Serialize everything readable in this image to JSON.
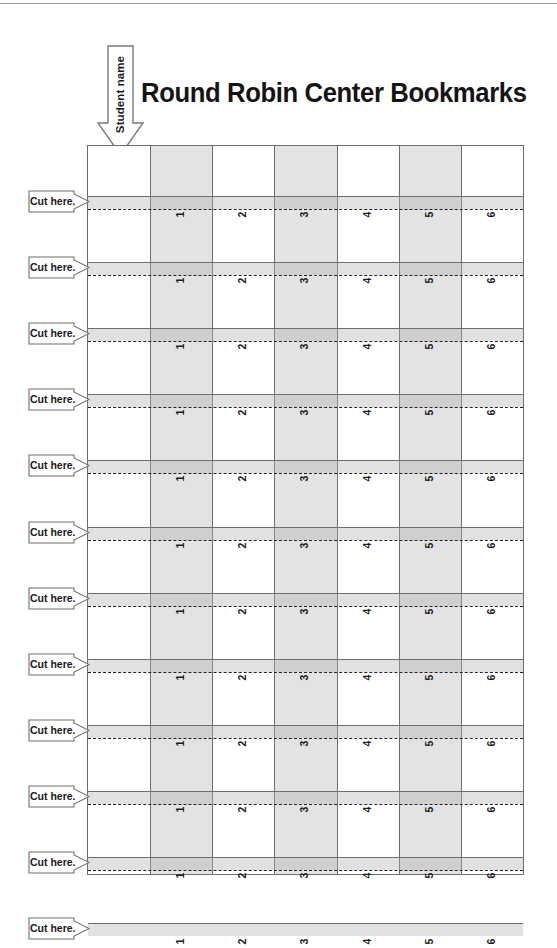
{
  "page": {
    "title": "Round Robin Center Bookmarks",
    "background_color": "#ffffff",
    "rule_color": "#9a9a9a"
  },
  "student_arrow": {
    "label": "Student name",
    "direction": "down",
    "icon": "down-arrow-icon"
  },
  "grid": {
    "column_count": 7,
    "shaded_color": "#e3e3e3",
    "border_color": "#6e6e6e",
    "name_column_label": "",
    "bookmark_numbers": [
      "1",
      "2",
      "3",
      "4",
      "5",
      "6"
    ],
    "shaded_columns": [
      1,
      3,
      5
    ]
  },
  "cut_rows": [
    {
      "label": "Cut here.",
      "has_dash": true
    },
    {
      "label": "Cut here.",
      "has_dash": true
    },
    {
      "label": "Cut here.",
      "has_dash": true
    },
    {
      "label": "Cut here.",
      "has_dash": true
    },
    {
      "label": "Cut here.",
      "has_dash": true
    },
    {
      "label": "Cut here.",
      "has_dash": true
    },
    {
      "label": "Cut here.",
      "has_dash": true
    },
    {
      "label": "Cut here.",
      "has_dash": true
    },
    {
      "label": "Cut here.",
      "has_dash": true
    },
    {
      "label": "Cut here.",
      "has_dash": true
    },
    {
      "label": "Cut here.",
      "has_dash": true
    },
    {
      "label": "Cut here.",
      "has_dash": false
    }
  ]
}
